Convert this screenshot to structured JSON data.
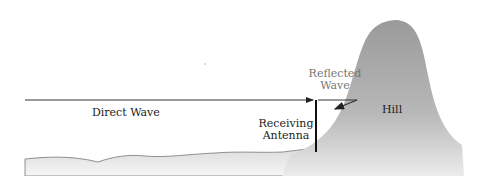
{
  "diagram": {
    "labels": {
      "direct_wave": "Direct Wave",
      "reflected_wave_line1": "Reflected",
      "reflected_wave_line2": "Wave",
      "receiving_antenna_line1": "Receiving",
      "receiving_antenna_line2": "Antenna",
      "hill": "Hill"
    },
    "colors": {
      "hill_top": "#9a9a9a",
      "hill_bottom": "#e6e6e6",
      "ground_fill": "#e3e3e3",
      "line": "#222222",
      "reflected_label": "#777777"
    }
  }
}
